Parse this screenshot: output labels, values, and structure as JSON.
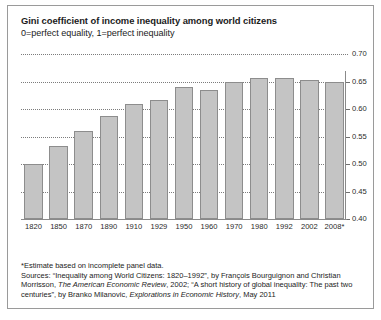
{
  "chart_data": {
    "type": "bar",
    "title": "Gini coefficient of income inequality among world citizens",
    "subtitle": "0=perfect equality, 1=perfect inequality",
    "xlabel": "",
    "ylabel": "",
    "ylim": [
      0.4,
      0.7
    ],
    "yticks": [
      0.4,
      0.45,
      0.5,
      0.55,
      0.6,
      0.65,
      0.7
    ],
    "ytick_labels": [
      "0.40",
      "0.45",
      "0.50",
      "0.55",
      "0.60",
      "0.65",
      "0.70"
    ],
    "grid": true,
    "legend": false,
    "categories": [
      "1820",
      "1850",
      "1870",
      "1890",
      "1910",
      "1929",
      "1950",
      "1960",
      "1970",
      "1980",
      "1992",
      "2002",
      "2008*"
    ],
    "values": [
      0.5,
      0.532,
      0.56,
      0.588,
      0.61,
      0.617,
      0.64,
      0.635,
      0.65,
      0.657,
      0.657,
      0.652,
      0.65
    ],
    "bar_color": "#c4c4c4",
    "bar_edge_color": "#8d8d8d",
    "gridline_color": "#7c7c7c",
    "axis_color": "#8a8a8a"
  },
  "notes": {
    "footnote": "*Estimate based on incomplete panel data.",
    "sources_line1_a": "Sources: “Inequality among World Citizens: 1820–1992”, by François Bourguignon and Christian",
    "sources_line2_a": "Morrisson, ",
    "sources_line2_italic": "The American Economic Review",
    "sources_line2_b": ", 2002; “A short history of global inequality: The past",
    "sources_line3_a": "two centuries”, by Branko Milanovic, ",
    "sources_line3_italic": "Explorations in Economic History",
    "sources_line3_b": ", May 2011"
  }
}
